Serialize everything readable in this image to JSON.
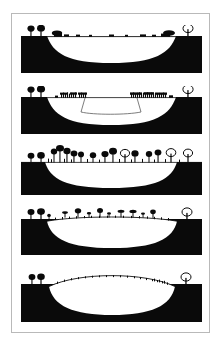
{
  "figure": {
    "panel_count": 5,
    "colors": {
      "ink": "#0a0a0a",
      "paper": "#ffffff",
      "frame": "#b9b9b9",
      "waterline": "#1a1a1a"
    },
    "frame": {
      "x": 11,
      "y": 13,
      "width": 199,
      "height": 320,
      "border_color": "#b9b9b9"
    }
  },
  "panels": [
    {
      "index": 1,
      "name": "open-water-lake-stage",
      "label": "Stage 1 - open water basin",
      "surface_type": "flat-waterline",
      "basin_fill": "white",
      "ground_fill": "black",
      "y": 25,
      "height": 48,
      "surface_level_pct": 22,
      "vegetation": {
        "left_upland_trees": 2,
        "right_upland_trees": 1,
        "edge_shrub_clumps": 2,
        "surface_marks": 9,
        "description": "bare open water with sparse marginal reeds"
      }
    },
    {
      "index": 2,
      "name": "reed-swamp-stage",
      "label": "Stage 2 - reed swamp encroachment",
      "surface_type": "flat-waterline",
      "basin_fill": "white",
      "ground_fill": "black",
      "y": 86,
      "height": 48,
      "surface_level_pct": 22,
      "inner_outline": "trapezoid",
      "vegetation": {
        "left_upland_trees": 2,
        "right_upland_trees": 1,
        "reed_bands": 2,
        "reed_stems_left": 18,
        "reed_stems_right": 22,
        "description": "dense reed beds advancing from both margins"
      }
    },
    {
      "index": 3,
      "name": "fen-carr-woodland-stage",
      "label": "Stage 3 - fen carr woodland",
      "surface_type": "flat-ground",
      "basin_fill": "white",
      "ground_fill": "black",
      "y": 145,
      "height": 50,
      "surface_level_pct": 34,
      "vegetation": {
        "left_upland_trees": 2,
        "right_upland_trees": 1,
        "canopy_trees": 14,
        "tallest_tree_pct": 96,
        "description": "closed carr woodland across the infilled basin"
      }
    },
    {
      "index": 4,
      "name": "transition-bog-stage",
      "label": "Stage 4 - transition bog, surface rising",
      "surface_type": "low-dome",
      "basin_fill": "white",
      "ground_fill": "black",
      "y": 205,
      "height": 50,
      "surface_level_pct": 30,
      "dome_rise_pct": 14,
      "vegetation": {
        "left_upland_trees": 2,
        "right_upland_trees": 1,
        "scattered_trees": 9,
        "tussock_marks": 22,
        "description": "thinning tree cover over a gently domed peat surface"
      }
    },
    {
      "index": 5,
      "name": "raised-bog-stage",
      "label": "Stage 5 - raised bog dome",
      "surface_type": "high-dome",
      "basin_fill": "white",
      "ground_fill": "black",
      "y": 266,
      "height": 56,
      "surface_level_pct": 40,
      "dome_rise_pct": 30,
      "vegetation": {
        "left_upland_trees": 2,
        "right_upland_trees": 1,
        "scattered_trees": 0,
        "tussock_marks": 34,
        "description": "treeless raised peat dome with sparse low hummocks"
      }
    }
  ]
}
